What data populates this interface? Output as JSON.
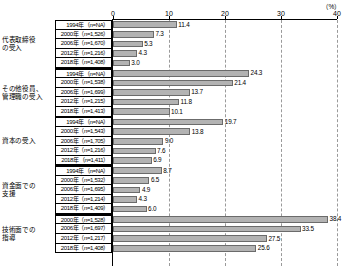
{
  "chart_data": {
    "type": "bar",
    "title": "",
    "xlabel": "",
    "ylabel": "",
    "unit": "（%）",
    "orientation": "horizontal",
    "xlim": [
      0,
      40
    ],
    "xticks": [
      0,
      10,
      20,
      30,
      40
    ],
    "xtick_labels": [
      "0",
      "10",
      "20",
      "30",
      "40"
    ],
    "grid": true,
    "grid_style": "dashed-vertical",
    "legend": "none",
    "bar_color": "#b3b3b3",
    "bar_border_color": "#6b6b6b",
    "groups": [
      {
        "category": "代表取締役\nの受入",
        "rows": [
          {
            "label": "1994年（n=NA）",
            "value": 11.4,
            "value_label": "11.4"
          },
          {
            "label": "2000年（n=1,526）",
            "value": 7.3,
            "value_label": "7.3"
          },
          {
            "label": "2006年（n=1,670）",
            "value": 5.3,
            "value_label": "5.3"
          },
          {
            "label": "2012年（n=1,216）",
            "value": 4.3,
            "value_label": "4.3"
          },
          {
            "label": "2018年（n=1,408）",
            "value": 3.0,
            "value_label": "3.0"
          }
        ]
      },
      {
        "category": "その他役員、\n管理職の受入",
        "rows": [
          {
            "label": "1994年（n=NA）",
            "value": 24.3,
            "value_label": "24.3"
          },
          {
            "label": "2000年（n=1,538）",
            "value": 21.4,
            "value_label": "21.4"
          },
          {
            "label": "2006年（n=1,699）",
            "value": 13.7,
            "value_label": "13.7"
          },
          {
            "label": "2012年（n=1,215）",
            "value": 11.8,
            "value_label": "11.8"
          },
          {
            "label": "2018年（n=1,413）",
            "value": 10.1,
            "value_label": "10.1"
          }
        ]
      },
      {
        "category": "資本の受入",
        "rows": [
          {
            "label": "1994年（n=NA）",
            "value": 19.7,
            "value_label": "19.7"
          },
          {
            "label": "2000年（n=1,543）",
            "value": 13.8,
            "value_label": "13.8"
          },
          {
            "label": "2006年（n=1,705）",
            "value": 9.0,
            "value_label": "9.0"
          },
          {
            "label": "2012年（n=1,216）",
            "value": 7.6,
            "value_label": "7.6"
          },
          {
            "label": "2018年（n=1,411）",
            "value": 6.9,
            "value_label": "6.9"
          }
        ]
      },
      {
        "category": "資金面での\n支援",
        "rows": [
          {
            "label": "1994年（n=NA）",
            "value": 8.7,
            "value_label": "8.7"
          },
          {
            "label": "2000年（n=1,532）",
            "value": 6.5,
            "value_label": "6.5"
          },
          {
            "label": "2006年（n=1,695）",
            "value": 4.9,
            "value_label": "4.9"
          },
          {
            "label": "2012年（n=1,214）",
            "value": 4.3,
            "value_label": "4.3"
          },
          {
            "label": "2018年（n=1,409）",
            "value": 6.0,
            "value_label": "6.0"
          }
        ]
      },
      {
        "category": "技術面での\n指導",
        "rows": [
          {
            "label": "2000年（n=1,528）",
            "value": 38.4,
            "value_label": "38.4"
          },
          {
            "label": "2006年（n=1,697）",
            "value": 33.5,
            "value_label": "33.5"
          },
          {
            "label": "2012年（n=1,217）",
            "value": 27.5,
            "value_label": "27.5"
          },
          {
            "label": "2018年（n=1,408）",
            "value": 25.6,
            "value_label": "25.6"
          }
        ]
      }
    ]
  }
}
